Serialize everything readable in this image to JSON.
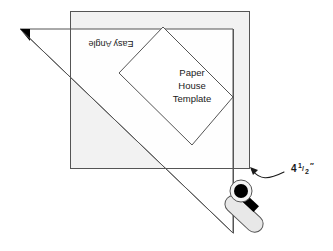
{
  "figure": {
    "type": "instructional-diagram"
  },
  "fabric_square": {
    "name": "fabric-square",
    "fill_color": "#f2f2f2",
    "stroke_color": "#555555"
  },
  "easy_angle_ruler": {
    "label": "Easy Angle",
    "label_rotation_degrees": 180,
    "fill_color": "#ffffff",
    "stroke_color": "#555555",
    "tip_marker": "black-triangle-tip"
  },
  "template": {
    "line1": "Paper",
    "line2": "House",
    "line3": "Template",
    "fill_color": "#ffffff",
    "stroke_color": "#555555"
  },
  "measurement": {
    "whole": "4",
    "numerator": "1",
    "denominator": "2",
    "fraction": "1/2",
    "unit": "″",
    "full_text": "4 1/2″",
    "callout": "leader-arrow-to-square-corner"
  },
  "rotary_cutter": {
    "name": "rotary-cutter",
    "blade_color": "#000000",
    "body_fill": "#e8e8e8",
    "body_stroke": "#555555",
    "grip_color": "#000000"
  },
  "colors": {
    "line": "#555555",
    "dark_line": "#222222",
    "fabric": "#f2f2f2",
    "white": "#ffffff",
    "black": "#000000"
  }
}
